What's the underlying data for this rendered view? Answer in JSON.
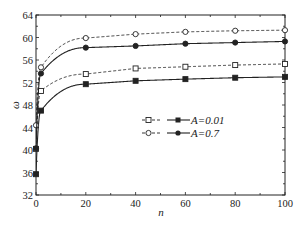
{
  "chart_data": {
    "type": "line",
    "title": "",
    "xlabel": "n",
    "ylabel": "ω",
    "xlim": [
      0,
      100
    ],
    "ylim": [
      32,
      64
    ],
    "xticks": [
      0,
      20,
      40,
      60,
      80,
      100
    ],
    "yticks": [
      32,
      36,
      40,
      44,
      48,
      52,
      56,
      60,
      64
    ],
    "grid": false,
    "legend_position": "inside center-right",
    "legend": [
      {
        "label": "A=0.01",
        "dashed_marker": "open-square",
        "solid_marker": "filled-square"
      },
      {
        "label": "A=0.7",
        "dashed_marker": "open-circle",
        "solid_marker": "filled-circle"
      }
    ],
    "x": [
      0,
      2,
      20,
      40,
      60,
      80,
      100
    ],
    "series": [
      {
        "name": "A=0.01 (dashed)",
        "style": "dashed",
        "marker": "open-square",
        "values": [
          40.2,
          50.5,
          53.5,
          54.5,
          54.8,
          55.1,
          55.3
        ]
      },
      {
        "name": "A=0.01 (solid)",
        "style": "solid",
        "marker": "filled-square",
        "values": [
          35.7,
          47.0,
          51.7,
          52.3,
          52.6,
          52.85,
          53.0
        ]
      },
      {
        "name": "A=0.7 (dashed)",
        "style": "dashed",
        "marker": "open-circle",
        "values": [
          44.4,
          54.7,
          59.9,
          60.6,
          61.0,
          61.2,
          61.3
        ]
      },
      {
        "name": "A=0.7 (solid)",
        "style": "solid",
        "marker": "filled-circle",
        "values": [
          40.3,
          53.6,
          58.2,
          58.5,
          58.9,
          59.1,
          59.3
        ]
      }
    ]
  },
  "legend": {
    "row1_label": "A=0.01",
    "row2_label": "A=0.7"
  },
  "axes": {
    "xlabel": "n",
    "ylabel": "ω"
  }
}
